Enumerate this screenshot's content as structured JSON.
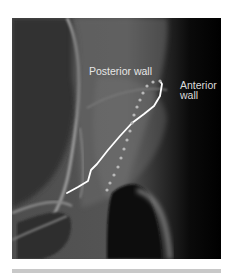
{
  "figure": {
    "type": "radiograph",
    "labels": {
      "posterior": "Posterior wall",
      "anterior_line1": "Anterior",
      "anterior_line2": "wall"
    },
    "annotations": {
      "posterior_wall": {
        "style": "solid",
        "color": "#ffffff"
      },
      "anterior_wall": {
        "style": "dotted",
        "color": "#bdbdbd"
      }
    }
  }
}
